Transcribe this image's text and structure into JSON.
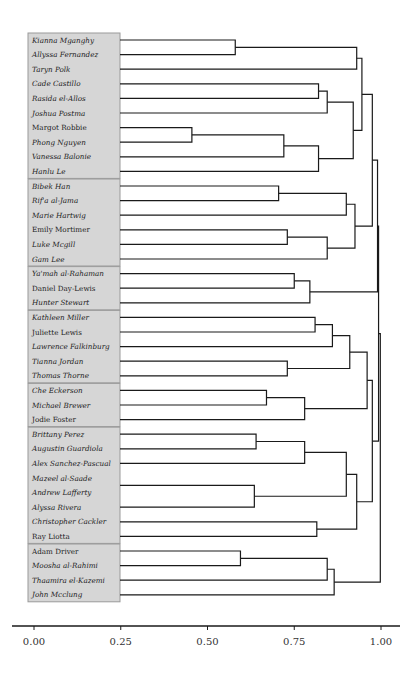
{
  "chart_data": {
    "type": "dendrogram",
    "title": "",
    "xlabel": "",
    "ylabel": "",
    "xlim": [
      0.0,
      1.0
    ],
    "x_ticks": [
      "0.00",
      "0.25",
      "0.50",
      "0.75",
      "1.00"
    ],
    "x_tick_values": [
      0.0,
      0.25,
      0.5,
      0.75,
      1.0
    ],
    "grid": false,
    "colors": {
      "box_fill": "#d6d6d6",
      "box_border": "#9a9a9a",
      "line": "#1a1a1a"
    },
    "leaves": [
      {
        "name": "Kianna Mganghy",
        "italic": true
      },
      {
        "name": "Allyssa Fernandez",
        "italic": true
      },
      {
        "name": "Taryn Polk",
        "italic": true
      },
      {
        "name": "Cade Castillo",
        "italic": true
      },
      {
        "name": "Rasida el-Allos",
        "italic": true
      },
      {
        "name": "Joshua Postma",
        "italic": true
      },
      {
        "name": "Margot Robbie",
        "italic": false
      },
      {
        "name": "Phong Nguyen",
        "italic": true
      },
      {
        "name": "Vanessa Balonie",
        "italic": true
      },
      {
        "name": "Hanlu Le",
        "italic": true
      },
      {
        "name": "Bibek Han",
        "italic": true
      },
      {
        "name": "Rif'a al-Jama",
        "italic": true
      },
      {
        "name": "Marie Hartwig",
        "italic": true
      },
      {
        "name": "Emily Mortimer",
        "italic": false
      },
      {
        "name": "Luke Mcgill",
        "italic": true
      },
      {
        "name": "Gam Lee",
        "italic": true
      },
      {
        "name": "Ya'mah al-Rahaman",
        "italic": true
      },
      {
        "name": "Daniel Day-Lewis",
        "italic": false
      },
      {
        "name": "Hunter Stewart",
        "italic": true
      },
      {
        "name": "Kathleen Miller",
        "italic": true
      },
      {
        "name": "Juliette Lewis",
        "italic": false
      },
      {
        "name": "Lawrence Falkinburg",
        "italic": true
      },
      {
        "name": "Tianna Jordan",
        "italic": true
      },
      {
        "name": "Thomas Thorne",
        "italic": true
      },
      {
        "name": "Che Eckerson",
        "italic": true
      },
      {
        "name": "Michael Brewer",
        "italic": true
      },
      {
        "name": "Jodie Foster",
        "italic": false
      },
      {
        "name": "Brittany Perez",
        "italic": true
      },
      {
        "name": "Augustin Guardiola",
        "italic": true
      },
      {
        "name": "Alex Sanchez-Pascual",
        "italic": true
      },
      {
        "name": "Mazeel al-Saade",
        "italic": true
      },
      {
        "name": "Andrew Lafferty",
        "italic": true
      },
      {
        "name": "Alyssa Rivera",
        "italic": true
      },
      {
        "name": "Christopher Cackler",
        "italic": true
      },
      {
        "name": "Ray Liotta",
        "italic": false
      },
      {
        "name": "Adam Driver",
        "italic": false
      },
      {
        "name": "Moosha al-Rahimi",
        "italic": true
      },
      {
        "name": "Thaamira el-Kazemi",
        "italic": true
      },
      {
        "name": "John Mcclung",
        "italic": true
      }
    ],
    "groups": [
      {
        "start": 0,
        "end": 9
      },
      {
        "start": 10,
        "end": 15
      },
      {
        "start": 16,
        "end": 18
      },
      {
        "start": 19,
        "end": 23
      },
      {
        "start": 24,
        "end": 26
      },
      {
        "start": 27,
        "end": 34
      },
      {
        "start": 35,
        "end": 38
      }
    ],
    "merges": [
      {
        "id": "m1",
        "a": "L0",
        "b": "L1",
        "height": 0.58
      },
      {
        "id": "m2",
        "a": "m1",
        "b": "L2",
        "height": 0.93
      },
      {
        "id": "m3",
        "a": "L3",
        "b": "L4",
        "height": 0.82
      },
      {
        "id": "m4",
        "a": "m3",
        "b": "L5",
        "height": 0.845
      },
      {
        "id": "m5",
        "a": "L6",
        "b": "L7",
        "height": 0.455
      },
      {
        "id": "m6",
        "a": "m5",
        "b": "L8",
        "height": 0.72
      },
      {
        "id": "m7",
        "a": "m6",
        "b": "L9",
        "height": 0.82
      },
      {
        "id": "m8",
        "a": "m4",
        "b": "m7",
        "height": 0.92
      },
      {
        "id": "m9",
        "a": "m2",
        "b": "m8",
        "height": 0.945
      },
      {
        "id": "m10",
        "a": "L10",
        "b": "L11",
        "height": 0.705
      },
      {
        "id": "m11",
        "a": "m10",
        "b": "L12",
        "height": 0.9
      },
      {
        "id": "m12",
        "a": "L13",
        "b": "L14",
        "height": 0.73
      },
      {
        "id": "m13",
        "a": "m12",
        "b": "L15",
        "height": 0.845
      },
      {
        "id": "m14",
        "a": "m11",
        "b": "m13",
        "height": 0.925
      },
      {
        "id": "m15",
        "a": "m9",
        "b": "m14",
        "height": 0.975
      },
      {
        "id": "m16",
        "a": "L16",
        "b": "L17",
        "height": 0.75
      },
      {
        "id": "m17",
        "a": "m16",
        "b": "L18",
        "height": 0.795
      },
      {
        "id": "m18",
        "a": "m15",
        "b": "m17",
        "height": 0.99
      },
      {
        "id": "m19",
        "a": "L19",
        "b": "L20",
        "height": 0.81
      },
      {
        "id": "m20",
        "a": "m19",
        "b": "L21",
        "height": 0.86
      },
      {
        "id": "m21",
        "a": "L22",
        "b": "L23",
        "height": 0.73
      },
      {
        "id": "m22",
        "a": "m20",
        "b": "m21",
        "height": 0.91
      },
      {
        "id": "m23",
        "a": "L24",
        "b": "L25",
        "height": 0.67
      },
      {
        "id": "m24",
        "a": "m23",
        "b": "L26",
        "height": 0.78
      },
      {
        "id": "m25",
        "a": "m22",
        "b": "m24",
        "height": 0.96
      },
      {
        "id": "m26",
        "a": "L27",
        "b": "L28",
        "height": 0.64
      },
      {
        "id": "m27",
        "a": "m26",
        "b": "L29",
        "height": 0.78
      },
      {
        "id": "m28",
        "a": "L30",
        "b": "L31",
        "height": 0.0
      },
      {
        "id": "m29",
        "a": "m28",
        "b": "L32",
        "height": 0.635
      },
      {
        "id": "m30",
        "a": "m27",
        "b": "m29",
        "height": 0.9
      },
      {
        "id": "m31",
        "a": "L33",
        "b": "L34",
        "height": 0.815
      },
      {
        "id": "m32",
        "a": "m30",
        "b": "m31",
        "height": 0.93
      },
      {
        "id": "m33",
        "a": "m25",
        "b": "m32",
        "height": 0.975
      },
      {
        "id": "m34",
        "a": "m18",
        "b": "m33",
        "height": 0.993
      },
      {
        "id": "m35",
        "a": "L35",
        "b": "L36",
        "height": 0.595
      },
      {
        "id": "m36",
        "a": "m35",
        "b": "L37",
        "height": 0.845
      },
      {
        "id": "m37",
        "a": "m36",
        "b": "L38",
        "height": 0.865
      },
      {
        "id": "m38",
        "a": "m34",
        "b": "m37",
        "height": 0.998
      }
    ]
  },
  "layout": {
    "x0": 34,
    "x1": 381,
    "leaf_y0": 40,
    "leaf_dy": 14.6,
    "box_x": 28,
    "box_w": 92,
    "axis_y": 626
  }
}
